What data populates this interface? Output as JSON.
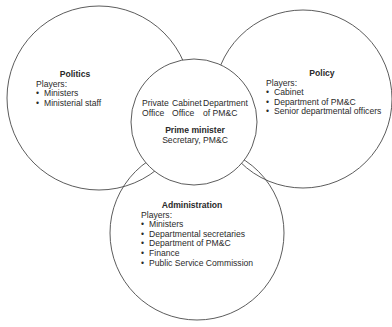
{
  "diagram": {
    "type": "venn",
    "circles": [
      {
        "id": "politics",
        "title": "Politics",
        "players_label": "Players:",
        "players": [
          "Ministers",
          "Ministerial staff"
        ]
      },
      {
        "id": "policy",
        "title": "Policy",
        "players_label": "Players:",
        "players": [
          "Cabinet",
          "Department of PM&C",
          "Senior departmental officers"
        ]
      },
      {
        "id": "administration",
        "title": "Administration",
        "players_label": "Players:",
        "players": [
          "Ministers",
          "Departmental secretaries",
          "Department of PM&C",
          "Finance",
          "Public Service Commission"
        ]
      }
    ],
    "center": {
      "offices": [
        {
          "line1": "Private",
          "line2": "Office"
        },
        {
          "line1": "Cabinet",
          "line2": "Office"
        },
        {
          "line1": "Department",
          "line2": "of PM&C"
        }
      ],
      "title": "Prime minister",
      "subtitle": "Secretary, PM&C"
    },
    "colors": {
      "stroke": "#4a4a4a",
      "text": "#2a2a2a",
      "background": "#ffffff"
    }
  }
}
